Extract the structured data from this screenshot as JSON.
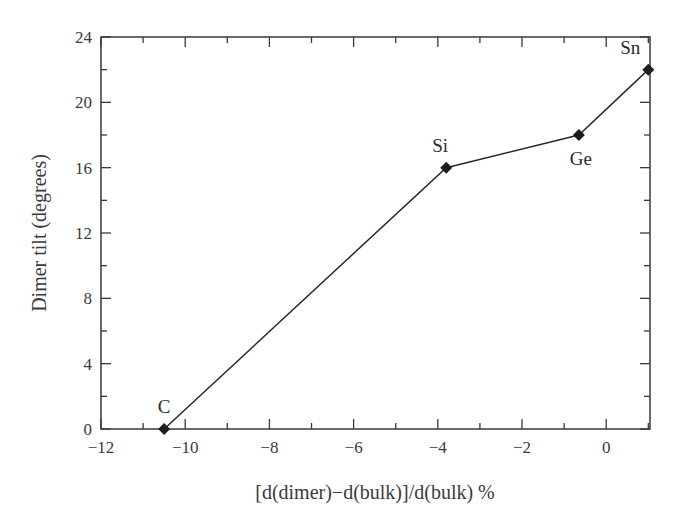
{
  "chart_data": {
    "type": "line",
    "title": "",
    "xlabel": "[d(dimer)−d(bulk)]/d(bulk) %",
    "ylabel": "Dimer tilt (degrees)",
    "xlim": [
      -12,
      1.04
    ],
    "ylim": [
      0,
      24
    ],
    "x_ticks": [
      -12,
      -10,
      -8,
      -6,
      -4,
      -2,
      0
    ],
    "x_tick_labels": [
      "−12",
      "−10",
      "−8",
      "−6",
      "−4",
      "−2",
      "0"
    ],
    "x_minor_step": 1,
    "y_ticks": [
      0,
      4,
      8,
      12,
      16,
      20,
      24
    ],
    "y_tick_labels": [
      "0",
      "4",
      "8",
      "12",
      "16",
      "20",
      "24"
    ],
    "y_minor_step": 2,
    "grid": false,
    "legend": null,
    "marker": "diamond",
    "line_color": "#2a2a2a",
    "series": [
      {
        "name": "Dimer tilt",
        "points": [
          {
            "label": "C",
            "x": -10.5,
            "y": 0
          },
          {
            "label": "Si",
            "x": -3.8,
            "y": 16
          },
          {
            "label": "Ge",
            "x": -0.65,
            "y": 18
          },
          {
            "label": "Sn",
            "x": 1.0,
            "y": 22
          }
        ]
      }
    ],
    "annotations": [
      {
        "text": "C",
        "x": -10.5,
        "y": 0,
        "position": "above"
      },
      {
        "text": "Si",
        "x": -3.8,
        "y": 16,
        "position": "above"
      },
      {
        "text": "Ge",
        "x": -0.65,
        "y": 18,
        "position": "below"
      },
      {
        "text": "Sn",
        "x": 1.0,
        "y": 22,
        "position": "above-left"
      }
    ]
  }
}
